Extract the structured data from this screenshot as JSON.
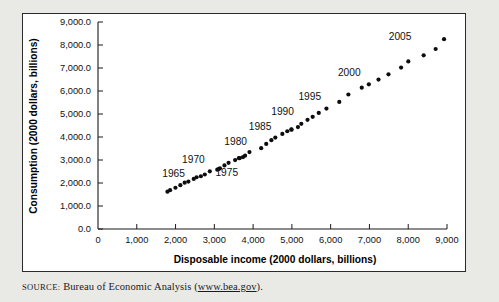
{
  "figure": {
    "source_label": "SOURCE:",
    "source_text": " Bureau of Economic Analysis (",
    "source_url": "www.bea.gov",
    "source_tail": ")."
  },
  "chart_data": {
    "type": "scatter",
    "title": "",
    "xlabel": "Disposable income (2000 dollars, billions)",
    "ylabel": "Consumption (2000 dollars, billions)",
    "xlim": [
      0,
      9000
    ],
    "ylim": [
      0,
      9000
    ],
    "xticks": [
      0,
      1000,
      2000,
      3000,
      4000,
      5000,
      6000,
      7000,
      8000,
      9000
    ],
    "xtick_labels": [
      "0",
      "1,000",
      "2,000",
      "3,000",
      "4,000",
      "5,000",
      "6,000",
      "7,000",
      "8,000",
      "9,000"
    ],
    "yticks": [
      0,
      1000,
      2000,
      3000,
      4000,
      5000,
      6000,
      7000,
      8000,
      9000
    ],
    "ytick_labels": [
      "0.0",
      "1,000.0",
      "2,000.0",
      "3,000.0",
      "4,000.0",
      "5,000.0",
      "6,000.0",
      "7,000.0",
      "8,000.0",
      "9,000.0"
    ],
    "grid": false,
    "legend": false,
    "marker": "filled-circle",
    "marker_color": "#0d0d0d",
    "point_label_field": "year",
    "points": [
      {
        "year": 1962,
        "x": 1791,
        "y": 1622
      },
      {
        "year": 1963,
        "x": 1859,
        "y": 1690
      },
      {
        "year": 1964,
        "x": 1997,
        "y": 1793
      },
      {
        "year": 1965,
        "x": 2123,
        "y": 1906
      },
      {
        "year": 1966,
        "x": 2235,
        "y": 2013
      },
      {
        "year": 1967,
        "x": 2331,
        "y": 2063
      },
      {
        "year": 1968,
        "x": 2469,
        "y": 2177
      },
      {
        "year": 1969,
        "x": 2542,
        "y": 2251
      },
      {
        "year": 1970,
        "x": 2653,
        "y": 2294
      },
      {
        "year": 1971,
        "x": 2755,
        "y": 2369
      },
      {
        "year": 1972,
        "x": 2884,
        "y": 2509
      },
      {
        "year": 1973,
        "x": 3111,
        "y": 2608
      },
      {
        "year": 1974,
        "x": 3076,
        "y": 2580
      },
      {
        "year": 1975,
        "x": 3144,
        "y": 2636
      },
      {
        "year": 1976,
        "x": 3261,
        "y": 2766
      },
      {
        "year": 1977,
        "x": 3367,
        "y": 2876
      },
      {
        "year": 1978,
        "x": 3536,
        "y": 2998
      },
      {
        "year": 1979,
        "x": 3632,
        "y": 3080
      },
      {
        "year": 1980,
        "x": 3657,
        "y": 3082
      },
      {
        "year": 1981,
        "x": 3740,
        "y": 3129
      },
      {
        "year": 1982,
        "x": 3792,
        "y": 3188
      },
      {
        "year": 1983,
        "x": 3906,
        "y": 3345
      },
      {
        "year": 1984,
        "x": 4208,
        "y": 3512
      },
      {
        "year": 1985,
        "x": 4338,
        "y": 3697
      },
      {
        "year": 1986,
        "x": 4471,
        "y": 3860
      },
      {
        "year": 1987,
        "x": 4573,
        "y": 3977
      },
      {
        "year": 1988,
        "x": 4754,
        "y": 4134
      },
      {
        "year": 1989,
        "x": 4881,
        "y": 4250
      },
      {
        "year": 1990,
        "x": 4985,
        "y": 4331
      },
      {
        "year": 1991,
        "x": 4992,
        "y": 4318
      },
      {
        "year": 1992,
        "x": 5156,
        "y": 4433
      },
      {
        "year": 1993,
        "x": 5243,
        "y": 4572
      },
      {
        "year": 1994,
        "x": 5403,
        "y": 4748
      },
      {
        "year": 1995,
        "x": 5536,
        "y": 4877
      },
      {
        "year": 1996,
        "x": 5693,
        "y": 5046
      },
      {
        "year": 1997,
        "x": 5891,
        "y": 5237
      },
      {
        "year": 1998,
        "x": 6222,
        "y": 5524
      },
      {
        "year": 1999,
        "x": 6457,
        "y": 5848
      },
      {
        "year": 2000,
        "x": 6802,
        "y": 6146
      },
      {
        "year": 2001,
        "x": 6985,
        "y": 6292
      },
      {
        "year": 2002,
        "x": 7234,
        "y": 6495
      },
      {
        "year": 2003,
        "x": 7491,
        "y": 6727
      },
      {
        "year": 2004,
        "x": 7816,
        "y": 7019
      },
      {
        "year": 2005,
        "x": 8002,
        "y": 7285
      },
      {
        "year": 2006,
        "x": 8398,
        "y": 7553
      },
      {
        "year": 2007,
        "x": 8707,
        "y": 7827
      },
      {
        "year": 2008,
        "x": 8924,
        "y": 8255
      }
    ],
    "annotations": [
      {
        "text": "1965",
        "x": 1950,
        "y": 2270
      },
      {
        "text": "1970",
        "x": 2460,
        "y": 2870
      },
      {
        "text": "1975",
        "x": 3320,
        "y": 2310
      },
      {
        "text": "1980",
        "x": 3550,
        "y": 3660
      },
      {
        "text": "1985",
        "x": 4180,
        "y": 4290
      },
      {
        "text": "1990",
        "x": 4760,
        "y": 4960
      },
      {
        "text": "1995",
        "x": 5460,
        "y": 5600
      },
      {
        "text": "2000",
        "x": 6480,
        "y": 6640
      },
      {
        "text": "2005",
        "x": 7790,
        "y": 8200
      }
    ]
  }
}
